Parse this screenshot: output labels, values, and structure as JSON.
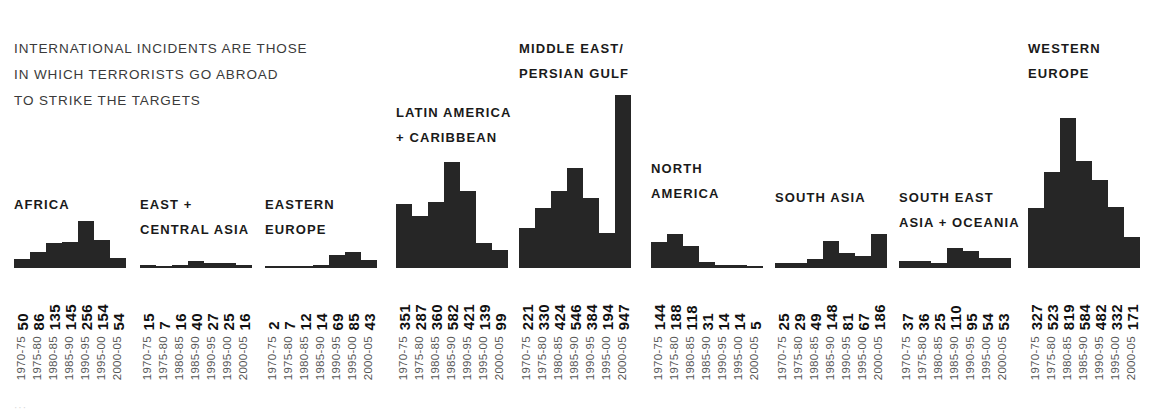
{
  "caption": {
    "lines": [
      "INTERNATIONAL INCIDENTS ARE THOSE",
      "IN WHICH TERRORISTS GO ABROAD",
      "TO STRIKE THE TARGETS"
    ]
  },
  "bottom_artifact": "···",
  "colors": {
    "bar": "#262626",
    "value_label": "#111111",
    "year_label": "#555555",
    "title": "#1a1a1a",
    "background": "#ffffff"
  },
  "chart_data": {
    "type": "bar",
    "title": "",
    "subtitle": "INTERNATIONAL INCIDENTS ARE THOSE IN WHICH TERRORISTS GO ABROAD TO STRIKE THE TARGETS",
    "xlabel": "",
    "ylabel": "",
    "grid": false,
    "legend": "none",
    "categories": [
      "1970-75",
      "1975-80",
      "1980-85",
      "1985-90",
      "1990-95",
      "1995-00",
      "2000-05"
    ],
    "ylim": [
      0,
      947
    ],
    "series": [
      {
        "name": "AFRICA",
        "title_lines": [
          "AFRICA"
        ],
        "values": [
          50,
          86,
          135,
          145,
          256,
          154,
          54
        ]
      },
      {
        "name": "EAST + CENTRAL ASIA",
        "title_lines": [
          "EAST +",
          "CENTRAL ASIA"
        ],
        "values": [
          15,
          7,
          16,
          40,
          27,
          25,
          16
        ]
      },
      {
        "name": "EASTERN EUROPE",
        "title_lines": [
          "EASTERN",
          "EUROPE"
        ],
        "values": [
          2,
          7,
          12,
          14,
          69,
          85,
          43
        ]
      },
      {
        "name": "LATIN AMERICA + CARIBBEAN",
        "title_lines": [
          "LATIN AMERICA",
          "+ CARIBBEAN"
        ],
        "values": [
          351,
          287,
          360,
          582,
          421,
          139,
          99
        ]
      },
      {
        "name": "MIDDLE EAST/PERSIAN GULF",
        "title_lines": [
          "MIDDLE EAST/",
          "PERSIAN GULF"
        ],
        "values": [
          221,
          330,
          424,
          546,
          384,
          194,
          947
        ]
      },
      {
        "name": "NORTH AMERICA",
        "title_lines": [
          "NORTH",
          "AMERICA"
        ],
        "values": [
          144,
          188,
          118,
          31,
          14,
          14,
          5
        ]
      },
      {
        "name": "SOUTH ASIA",
        "title_lines": [
          "SOUTH ASIA"
        ],
        "values": [
          25,
          29,
          49,
          148,
          81,
          67,
          186
        ]
      },
      {
        "name": "SOUTH EAST ASIA + OCEANIA",
        "title_lines": [
          "SOUTH EAST",
          "ASIA + OCEANIA"
        ],
        "values": [
          37,
          36,
          25,
          110,
          95,
          54,
          53
        ]
      },
      {
        "name": "WESTERN EUROPE",
        "title_lines": [
          "WESTERN",
          "EUROPE"
        ],
        "values": [
          327,
          523,
          819,
          584,
          482,
          332,
          171
        ]
      }
    ]
  },
  "layout": {
    "baseline_y": 268,
    "px_per_unit": 0.1827,
    "bar_width": 16,
    "values_top": 278,
    "years_top": 336,
    "groups": [
      {
        "left": 14,
        "title_top": 192
      },
      {
        "left": 140,
        "title_top": 192
      },
      {
        "left": 265,
        "title_top": 192
      },
      {
        "left": 396,
        "title_top": 100
      },
      {
        "left": 519,
        "title_top": 36
      },
      {
        "left": 651,
        "title_top": 156
      },
      {
        "left": 775,
        "title_top": 185
      },
      {
        "left": 899,
        "title_top": 185
      },
      {
        "left": 1028,
        "title_top": 36
      }
    ]
  }
}
